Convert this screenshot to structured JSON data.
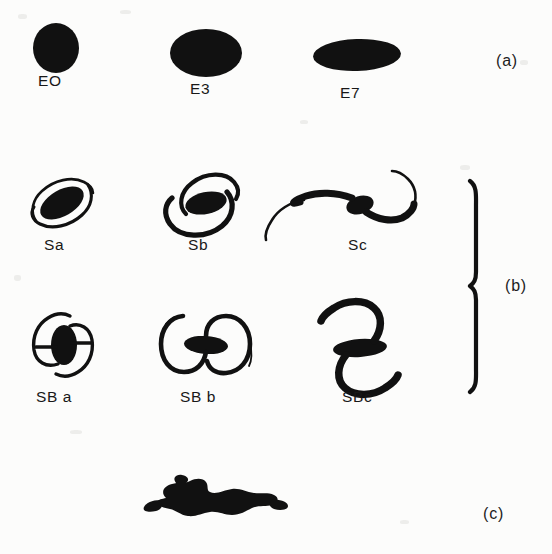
{
  "figure": {
    "background_color": "#fcfcfb",
    "ink_color": "#111111",
    "width": 552,
    "height": 554
  },
  "panels": [
    {
      "id": "a",
      "label": "(a)",
      "x": 496,
      "y": 52,
      "type": "ellipticals"
    },
    {
      "id": "b",
      "label": "(b)",
      "x": 505,
      "y": 277,
      "type": "spirals"
    },
    {
      "id": "c",
      "label": "(c)",
      "x": 483,
      "y": 505,
      "type": "irregular"
    }
  ],
  "brace": {
    "name": "spiral-group-brace",
    "x": 474,
    "top": 180,
    "bottom": 392
  },
  "rows": [
    {
      "id": "ellipticals",
      "panel": "a",
      "galaxies": [
        {
          "name": "E0",
          "label": "EO",
          "label_x": 38,
          "label_y": 72,
          "cx": 56,
          "cy": 48,
          "rx": 23,
          "ry": 25,
          "shape": "ellipse",
          "tilt": 0
        },
        {
          "name": "E3",
          "label": "E3",
          "label_x": 190,
          "label_y": 80,
          "cx": 206,
          "cy": 53,
          "rx": 36,
          "ry": 24,
          "shape": "ellipse",
          "tilt": 0
        },
        {
          "name": "E7",
          "label": "E7",
          "label_x": 340,
          "label_y": 84,
          "cx": 357,
          "cy": 55,
          "rx": 44,
          "ry": 16,
          "shape": "ellipse",
          "tilt": -2
        }
      ]
    },
    {
      "id": "normal-spirals",
      "panel": "b",
      "galaxies": [
        {
          "name": "Sa",
          "label": "Sa",
          "label_x": 44,
          "label_y": 236,
          "cx": 62,
          "cy": 203,
          "shape": "spiral"
        },
        {
          "name": "Sb",
          "label": "Sb",
          "label_x": 188,
          "label_y": 236,
          "cx": 206,
          "cy": 203,
          "shape": "spiral"
        },
        {
          "name": "Sc",
          "label": "Sc",
          "label_x": 348,
          "label_y": 236,
          "cx": 360,
          "cy": 203,
          "shape": "spiral"
        }
      ]
    },
    {
      "id": "barred-spirals",
      "panel": "b",
      "galaxies": [
        {
          "name": "SBa",
          "label": "SB a",
          "label_x": 36,
          "label_y": 388,
          "cx": 64,
          "cy": 345,
          "shape": "barred-spiral"
        },
        {
          "name": "SBb",
          "label": "SB b",
          "label_x": 180,
          "label_y": 388,
          "cx": 206,
          "cy": 345,
          "shape": "barred-spiral"
        },
        {
          "name": "SBc",
          "label": "SBc",
          "label_x": 342,
          "label_y": 388,
          "cx": 360,
          "cy": 345,
          "shape": "barred-spiral"
        }
      ]
    },
    {
      "id": "irregular",
      "panel": "c",
      "galaxies": [
        {
          "name": "Irr",
          "label": "",
          "label_x": 0,
          "label_y": 0,
          "cx": 218,
          "cy": 495,
          "shape": "irregular"
        }
      ]
    }
  ]
}
